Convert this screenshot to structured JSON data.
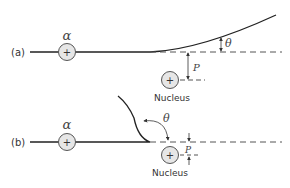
{
  "diagram": {
    "panels": [
      {
        "id": "a",
        "label": "(a)",
        "particle_symbol": "α",
        "particle_charge": "+",
        "nucleus_charge": "+",
        "nucleus_label": "Nucleus",
        "impact_parameter_label": "P",
        "angle_label": "θ",
        "description": "Large impact parameter, small scattering angle"
      },
      {
        "id": "b",
        "label": "(b)",
        "particle_symbol": "α",
        "particle_charge": "+",
        "nucleus_charge": "+",
        "nucleus_label": "Nucleus",
        "impact_parameter_label": "P",
        "angle_label": "θ",
        "description": "Small impact parameter, large scattering angle"
      }
    ],
    "colors": {
      "line": "#222222",
      "dashed": "#555555",
      "circle_fill": "#e6e6e6",
      "circle_stroke": "#555555"
    }
  }
}
